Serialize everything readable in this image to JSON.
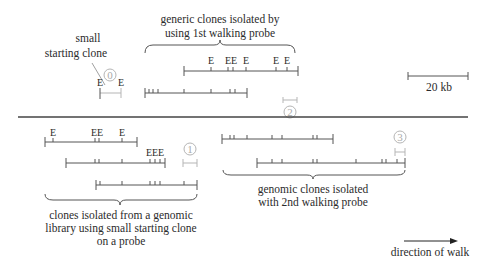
{
  "labels": {
    "small_clone": [
      "small",
      "starting clone"
    ],
    "first_walk": [
      "generic clones isolated by",
      "using 1st walking probe"
    ],
    "library": [
      "clones isolated from a genomic",
      "library using small starting clone",
      "on a probe"
    ],
    "second_walk": [
      "genomic clones isolated",
      "with 2nd walking probe"
    ],
    "scale": "20 kb",
    "direction": "direction of walk",
    "ecori": "E"
  },
  "probes": [
    "0",
    "1",
    "2",
    "3"
  ],
  "colors": {
    "line": "#555555",
    "probe": "#b5b5b5",
    "text": "#2b2b2b",
    "divider": "#444444"
  }
}
